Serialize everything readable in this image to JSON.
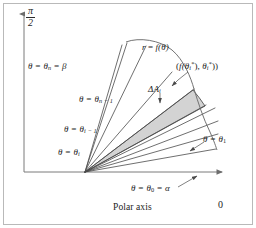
{
  "figure": {
    "axes": {
      "vertical_label": "π/2",
      "vertical_numerator": "π",
      "vertical_denominator": "2",
      "horizontal_label": "Polar axis",
      "horizontal_end_label": "0"
    },
    "labels": {
      "theta_n": "θ = θn = β",
      "theta_n_parts": {
        "lhs": "θ = θ",
        "sub": "n",
        "rhs": " = β"
      },
      "theta_n_minus_1_parts": {
        "lhs": "θ = θ",
        "sub": "n − 1"
      },
      "theta_i_minus_1_parts": {
        "lhs": "θ = θ",
        "sub": "i − 1"
      },
      "theta_i_parts": {
        "lhs": "θ = θ",
        "sub": "i"
      },
      "theta_1_parts": {
        "lhs": "θ = θ",
        "sub": "1"
      },
      "theta_0_parts": {
        "lhs": "θ = θ",
        "sub": "0",
        "rhs": " = α"
      },
      "curve": "r = f(θ)",
      "curve_parts": {
        "lhs": "r",
        "eq": " = ",
        "fn": "f",
        "arg": "(θ)"
      },
      "delta_area": "ΔAi",
      "delta_area_parts": {
        "lhs": "ΔA",
        "sub": "i"
      },
      "sample_point": "(f(θi*), θi*))",
      "sample_point_parts": {
        "open": "(",
        "f": "f",
        "paren_open": "(θ",
        "sub1": "i",
        "sup1": "*",
        "paren_close": "), ",
        "theta2": "θ",
        "sub2": "i",
        "sup2": "*",
        "close": "))"
      }
    },
    "colors": {
      "stroke": "#4a4a4a",
      "axis": "#7a7a7a",
      "shade_fill": "#cfcfcf",
      "frame": "#b9b9b9",
      "text": "#1c1c1c"
    },
    "geometry": {
      "pole": [
        85,
        172
      ],
      "ray_angles_deg": [
        10,
        16,
        21,
        26,
        33,
        42,
        52,
        62,
        70,
        77
      ],
      "shaded_sector_index": 6
    }
  }
}
